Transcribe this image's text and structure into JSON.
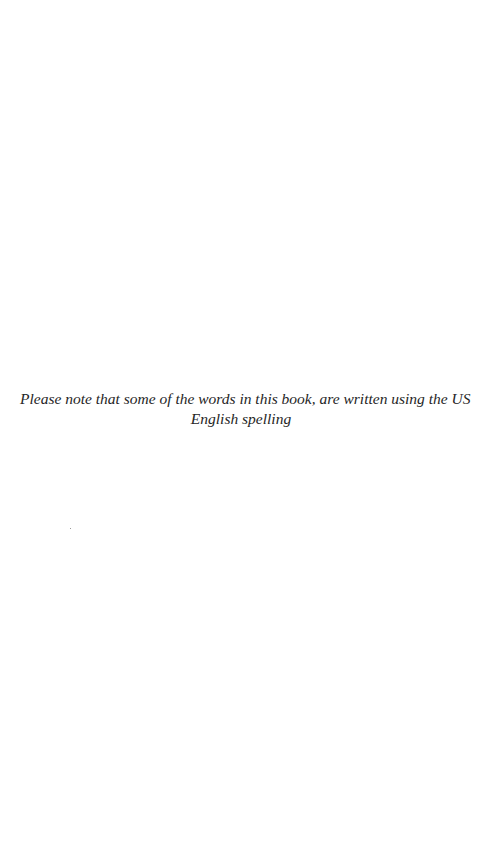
{
  "page": {
    "background_color": "#ffffff",
    "text_color": "#262626"
  },
  "note": {
    "lines": [
      "Please note that some of the words in this book, are written using the US",
      "English spelling"
    ]
  }
}
